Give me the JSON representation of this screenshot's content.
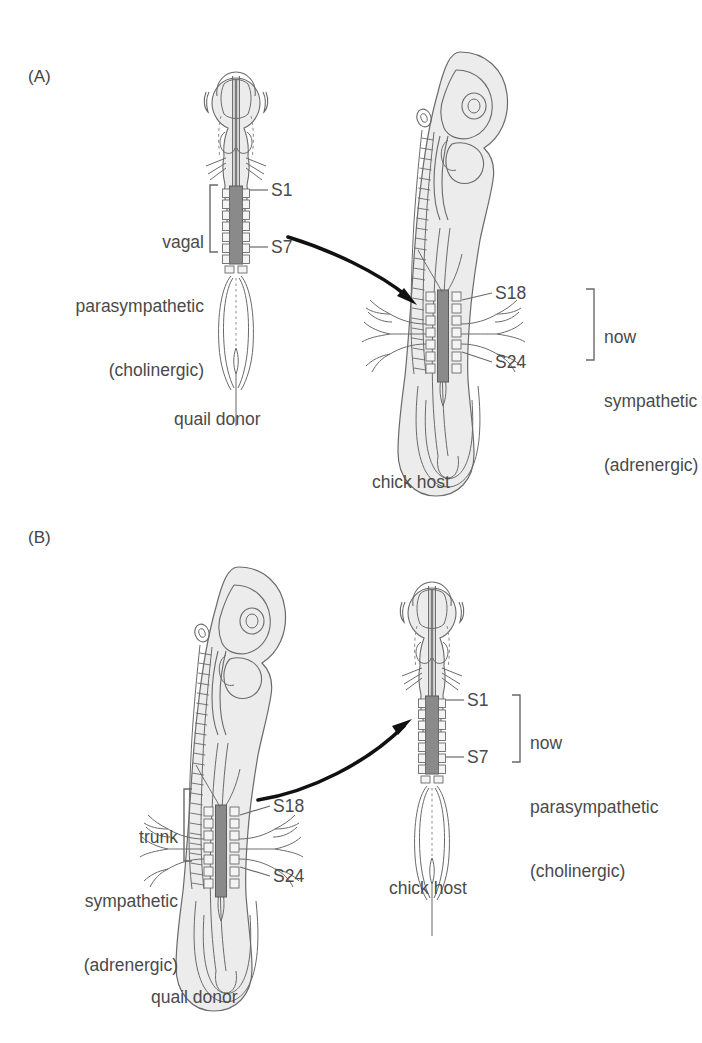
{
  "figure": {
    "type": "biology-diagram",
    "background_color": "#ffffff",
    "line_color": "#4a4a4a",
    "body_fill": "#ececec",
    "graft_fill": "#8a8a8a",
    "somite_fill": "#f2f2f2"
  },
  "panelA": {
    "letter": "(A)",
    "donor_caption": "quail donor",
    "host_caption": "chick host",
    "left_label": {
      "line1": "vagal",
      "line2": "parasympathetic",
      "line3": "(cholinergic)"
    },
    "right_label": {
      "line1": "now",
      "line2": "sympathetic",
      "line3": "(adrenergic)"
    },
    "donor_somite_top": "S1",
    "donor_somite_bottom": "S7",
    "host_somite_top": "S18",
    "host_somite_bottom": "S24"
  },
  "panelB": {
    "letter": "(B)",
    "donor_caption": "quail donor",
    "host_caption": "chick host",
    "left_label": {
      "line1": "trunk",
      "line2": "sympathetic",
      "line3": "(adrenergic)"
    },
    "right_label": {
      "line1": "now",
      "line2": "parasympathetic",
      "line3": "(cholinergic)"
    },
    "donor_somite_top": "S18",
    "donor_somite_bottom": "S24",
    "host_somite_top": "S1",
    "host_somite_bottom": "S7"
  }
}
